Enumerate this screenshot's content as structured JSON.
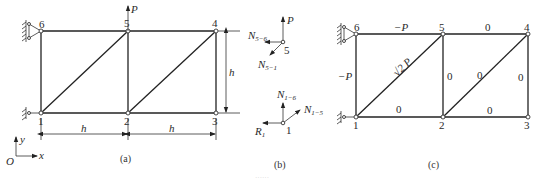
{
  "figure": {
    "panels": [
      {
        "id": "a",
        "caption": "(a)",
        "nodes": [
          {
            "id": "1",
            "label": "1"
          },
          {
            "id": "2",
            "label": "2"
          },
          {
            "id": "3",
            "label": "3"
          },
          {
            "id": "4",
            "label": "4"
          },
          {
            "id": "5",
            "label": "5"
          },
          {
            "id": "6",
            "label": "6"
          }
        ],
        "load": {
          "label": "P",
          "node": "5",
          "direction": "up"
        },
        "dimensions": {
          "bay1": "h",
          "bay2": "h",
          "height": "h"
        },
        "axes": {
          "origin": "O",
          "x": "x",
          "y": "y"
        }
      },
      {
        "id": "b",
        "caption": "(b)",
        "free_body_node5": {
          "node": "5",
          "load": "P",
          "forces": [
            {
              "main": "N",
              "sub": "5−6"
            },
            {
              "main": "N",
              "sub": "5−1"
            }
          ]
        },
        "free_body_node1": {
          "node": "1",
          "forces": [
            {
              "main": "N",
              "sub": "1−6"
            },
            {
              "main": "N",
              "sub": "1−5"
            },
            {
              "main": "R",
              "sub": "1"
            }
          ]
        }
      },
      {
        "id": "c",
        "caption": "(c)",
        "nodes": [
          {
            "id": "1",
            "label": "1"
          },
          {
            "id": "2",
            "label": "2"
          },
          {
            "id": "3",
            "label": "3"
          },
          {
            "id": "4",
            "label": "4"
          },
          {
            "id": "5",
            "label": "5"
          },
          {
            "id": "6",
            "label": "6"
          }
        ],
        "member_forces": {
          "m6_5": "−P",
          "m5_4": "0",
          "m6_1": "−P",
          "m1_5": "√2 P",
          "m1_2": "0",
          "m5_2": "0",
          "m2_4": "0",
          "m4_3": "0",
          "m2_3": "0"
        }
      }
    ],
    "footer_caption": "······"
  }
}
